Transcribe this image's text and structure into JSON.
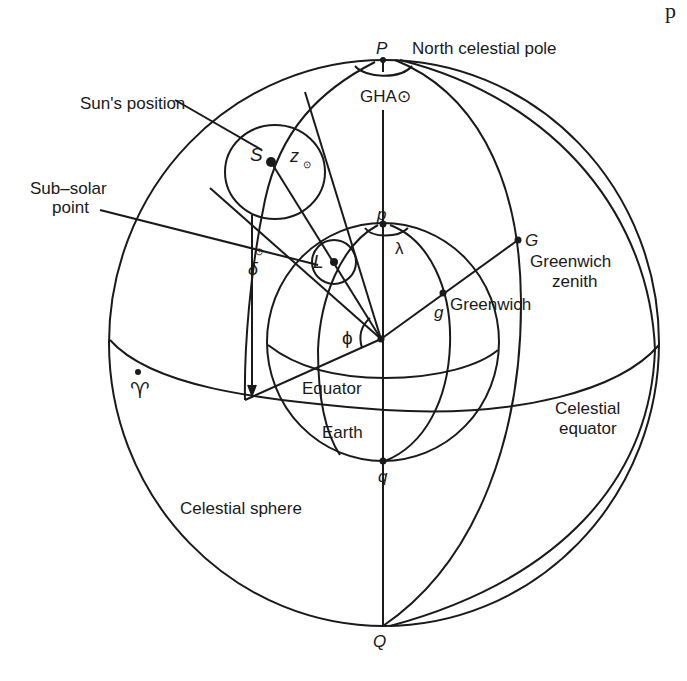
{
  "figure": {
    "title_fragment": "p",
    "points": {
      "P": "P",
      "p": "p",
      "S": "S",
      "L": "L",
      "G": "G",
      "g": "g",
      "q": "q",
      "Q": "Q",
      "aries": "♈"
    },
    "labels": {
      "north_celestial_pole": "North celestial pole",
      "gha": "GHA⊙",
      "suns_position": "Sun's position",
      "sub_solar_line1": "Sub–solar",
      "sub_solar_line2": "point",
      "greenwich_zenith_line1": "Greenwich",
      "greenwich_zenith_line2": "zenith",
      "greenwich": "Greenwich",
      "equator": "Equator",
      "earth": "Earth",
      "celestial_equator_line1": "Celestial",
      "celestial_equator_line2": "equator",
      "celestial_sphere": "Celestial sphere"
    },
    "angles": {
      "lambda": "λ",
      "phi": "ϕ",
      "z_sun": "z",
      "z_sub": "⊙",
      "delta": "δ",
      "delta_sup": "⊙"
    },
    "stroke_color": "#1a1a1a",
    "background": "#ffffff"
  }
}
